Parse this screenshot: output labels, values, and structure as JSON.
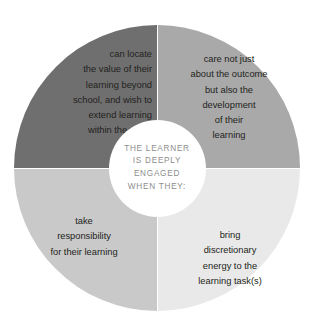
{
  "chart_data": {
    "type": "pie",
    "title": "",
    "center_label": {
      "lines": [
        "THE LEARNER",
        "IS DEEPLY",
        "ENGAGED",
        "WHEN THEY:"
      ],
      "color": "#8d8d8d"
    },
    "legend": "none",
    "categories": [
      "can locate the value of their learning beyond school, and wish to extend learning within the wider world.",
      "care not just about the outcome but also the development of their learning",
      "take responsibility for their learning",
      "bring discretionary energy to the learning task(s)"
    ],
    "values": [
      25,
      25,
      25,
      25
    ],
    "colors": [
      "#6f6f6f",
      "#a9a9a9",
      "#c9c9c9",
      "#e9e9e9"
    ]
  },
  "diagram": {
    "segments": [
      {
        "id": "top-left",
        "position": "top-left",
        "color": "#6f6f6f",
        "lines": [
          "can locate",
          "the value of their",
          "learning beyond",
          "school, and wish to",
          "extend learning",
          "within the wider",
          "world."
        ],
        "footnote": "76"
      },
      {
        "id": "top-right",
        "position": "top-right",
        "color": "#a9a9a9",
        "lines": [
          "care not just",
          "about the outcome",
          "but also the",
          "development",
          "of their",
          "learning"
        ]
      },
      {
        "id": "bottom-left",
        "position": "bottom-left",
        "color": "#c9c9c9",
        "lines": [
          "take",
          "responsibility",
          "for their learning"
        ]
      },
      {
        "id": "bottom-right",
        "position": "bottom-right",
        "color": "#e9e9e9",
        "lines": [
          "bring",
          "discretionary",
          "energy to the",
          "learning task(s)"
        ]
      }
    ],
    "center": {
      "line1": "THE LEARNER",
      "line2": "IS DEEPLY",
      "line3": "ENGAGED",
      "line4": "WHEN THEY:"
    }
  }
}
